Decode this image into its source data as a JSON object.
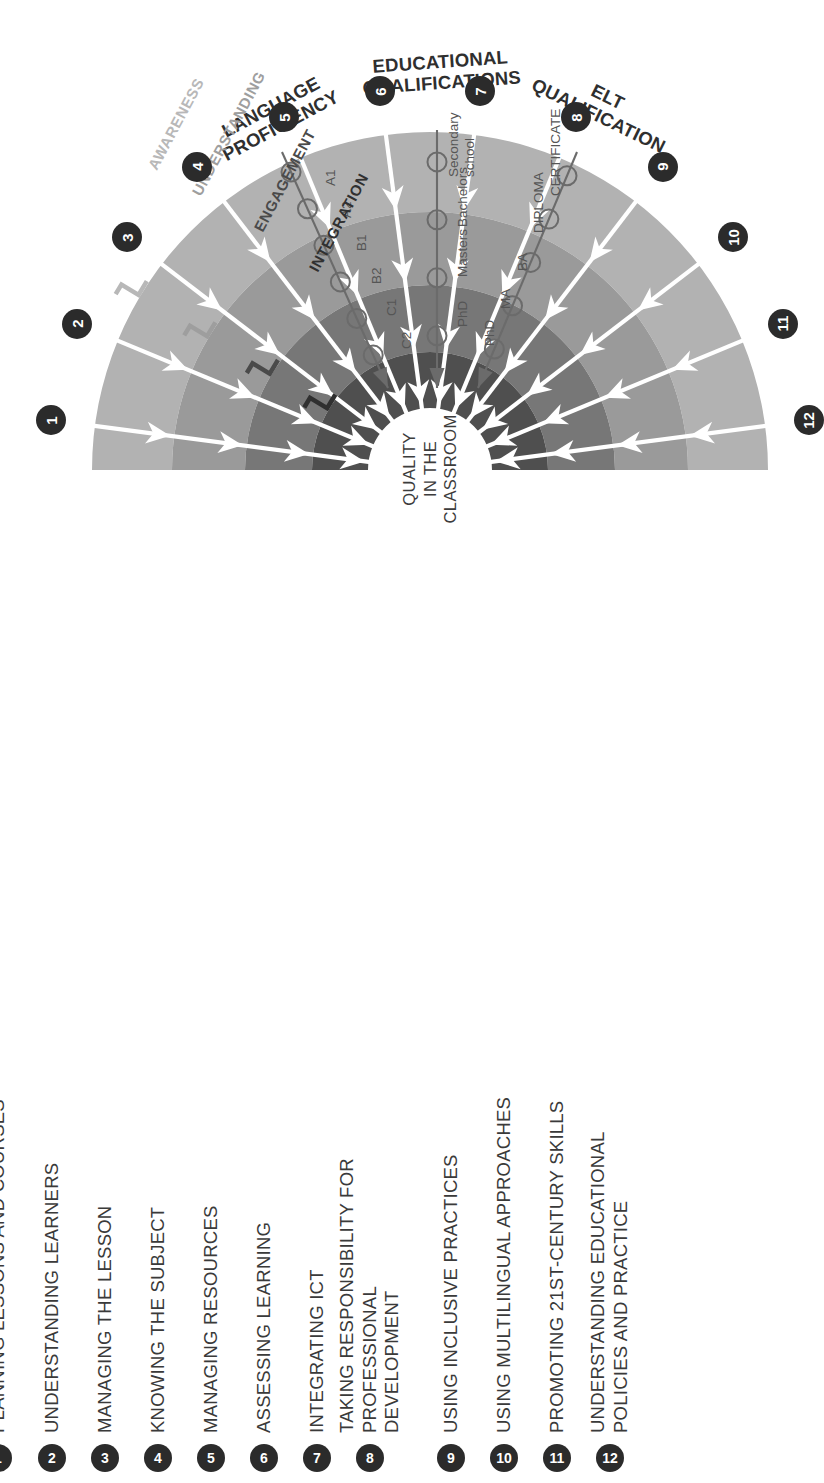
{
  "center": {
    "label": "QUALITY\nIN THE\nCLASSROOM"
  },
  "stages": [
    {
      "id": "awareness",
      "label": "AWARENESS",
      "color": "#b2b2b2",
      "text_color": "#b8b8b8"
    },
    {
      "id": "understanding",
      "label": "UNDERSTANDING",
      "color": "#9a9a9a",
      "text_color": "#9e9e9e"
    },
    {
      "id": "engagement",
      "label": "ENGAGEMENT",
      "color": "#777777",
      "text_color": "#4a4a4a"
    },
    {
      "id": "integration",
      "label": "INTEGRATION",
      "color": "#4f4f4f",
      "text_color": "#303030"
    }
  ],
  "scales": [
    {
      "id": "language-proficiency",
      "title": "LANGUAGE\nPROFICIENCY",
      "ticks": [
        "A1",
        "A2",
        "B1",
        "B2",
        "C1",
        "C2"
      ]
    },
    {
      "id": "educational-qualifications",
      "title": "EDUCATIONAL\nQUALIFICATIONS",
      "ticks": [
        "Secondary\nschool",
        "Bachelors",
        "Masters",
        "PhD"
      ]
    },
    {
      "id": "elt-qualification",
      "title": "ELT\nQUALIFICATION",
      "ticks": [
        "CERTIFICATE",
        "DIPLOMA",
        "BA",
        "MA",
        "PhD"
      ]
    }
  ],
  "competencies": [
    {
      "num": "1",
      "label": "PLANNING LESSONS AND COURSES"
    },
    {
      "num": "2",
      "label": "UNDERSTANDING LEARNERS"
    },
    {
      "num": "3",
      "label": "MANAGING THE LESSON"
    },
    {
      "num": "4",
      "label": "KNOWING THE SUBJECT"
    },
    {
      "num": "5",
      "label": "MANAGING RESOURCES"
    },
    {
      "num": "6",
      "label": "ASSESSING LEARNING"
    },
    {
      "num": "7",
      "label": "INTEGRATING ICT"
    },
    {
      "num": "8",
      "label": "TAKING RESPONSIBILITY FOR PROFESSIONAL\nDEVELOPMENT"
    },
    {
      "num": "9",
      "label": "USING INCLUSIVE PRACTICES"
    },
    {
      "num": "10",
      "label": "USING MULTILINGUAL APPROACHES"
    },
    {
      "num": "11",
      "label": "PROMOTING 21ST-CENTURY SKILLS"
    },
    {
      "num": "12",
      "label": "UNDERSTANDING EDUCATIONAL POLICIES AND PRACTICE"
    }
  ],
  "colors": {
    "badge_bg": "#2b2b2b",
    "badge_text": "#ffffff",
    "text": "#3a3a3a",
    "arrow": "#ffffff",
    "scale_line": "#6b6b6b",
    "background": "#ffffff"
  }
}
